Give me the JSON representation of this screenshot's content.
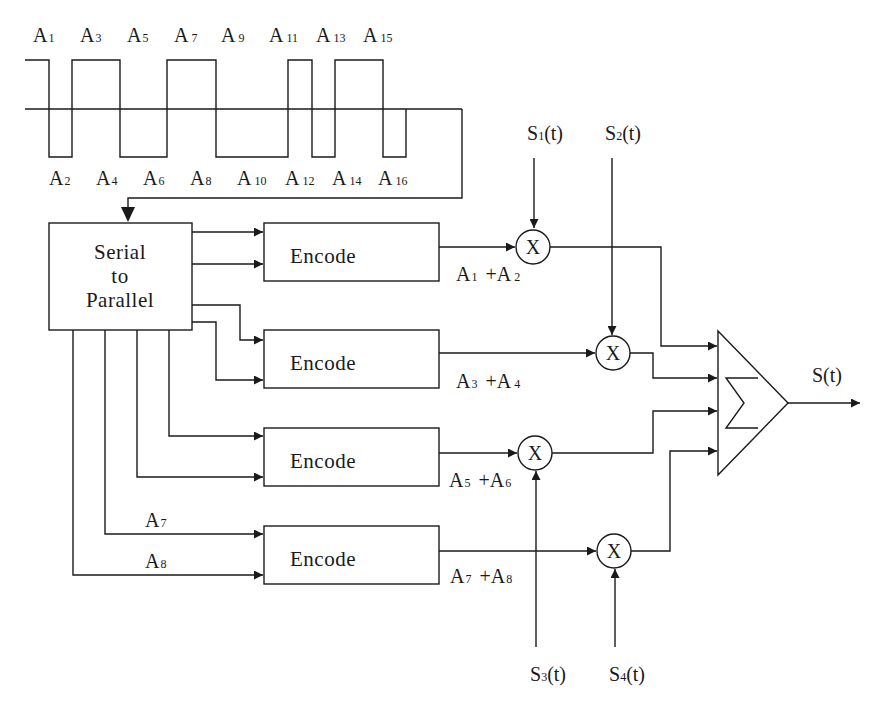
{
  "diagram": {
    "type": "block-diagram",
    "waveform": {
      "top_labels": [
        {
          "base": "A",
          "sub": "1"
        },
        {
          "base": "A",
          "sub": "3"
        },
        {
          "base": "A",
          "sub": "5"
        },
        {
          "base": "A",
          "sub": "7"
        },
        {
          "base": "A",
          "sub": "9"
        },
        {
          "base": "A",
          "sub": "11"
        },
        {
          "base": "A",
          "sub": "13"
        },
        {
          "base": "A",
          "sub": "15"
        }
      ],
      "bottom_labels": [
        {
          "base": "A",
          "sub": "2"
        },
        {
          "base": "A",
          "sub": "4"
        },
        {
          "base": "A",
          "sub": "6"
        },
        {
          "base": "A",
          "sub": "8"
        },
        {
          "base": "A",
          "sub": "10"
        },
        {
          "base": "A",
          "sub": "12"
        },
        {
          "base": "A",
          "sub": "14"
        },
        {
          "base": "A",
          "sub": "16"
        }
      ]
    },
    "serial_to_parallel": {
      "line1": "Serial",
      "line2": "to",
      "line3": "Parallel"
    },
    "encoders": [
      {
        "label": "Encode",
        "output": {
          "a": "A",
          "as": "1",
          "plus": "+",
          "b": "A",
          "bs": "2"
        }
      },
      {
        "label": "Encode",
        "output": {
          "a": "A",
          "as": "3",
          "plus": "+",
          "b": "A",
          "bs": "4"
        }
      },
      {
        "label": "Encode",
        "output": {
          "a": "A",
          "as": "5",
          "plus": "+",
          "b": "A",
          "bs": "6"
        }
      },
      {
        "label": "Encode",
        "output": {
          "a": "A",
          "as": "7",
          "plus": "+",
          "b": "A",
          "bs": "8"
        }
      }
    ],
    "encoder4_inputs": [
      {
        "base": "A",
        "sub": "7"
      },
      {
        "base": "A",
        "sub": "8"
      }
    ],
    "multiplier_symbol": "X",
    "carriers": [
      {
        "base": "S",
        "sub": "1",
        "arg": "(t)"
      },
      {
        "base": "S",
        "sub": "2",
        "arg": "(t)"
      },
      {
        "base": "S",
        "sub": "3",
        "arg": "(t)"
      },
      {
        "base": "S",
        "sub": "4",
        "arg": "(t)"
      }
    ],
    "summer_symbol": "Σ",
    "output": {
      "label": "S(t)"
    }
  }
}
